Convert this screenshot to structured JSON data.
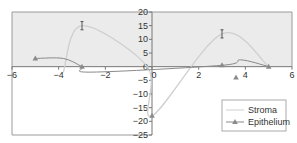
{
  "chart_data": {
    "type": "line",
    "title": "",
    "xlabel": "",
    "ylabel": "",
    "xlim": [
      -6,
      6
    ],
    "ylim": [
      -25,
      20
    ],
    "xticks": [
      -6,
      -4,
      -2,
      0,
      2,
      4,
      6
    ],
    "yticks": [
      20,
      15,
      10,
      5,
      0,
      -5,
      -10,
      -15,
      -20,
      -25
    ],
    "grid": false,
    "shaded_region": {
      "from": 0,
      "to": 20,
      "color": "#ebebeb"
    },
    "legend": {
      "position": "bottom-right",
      "entries": [
        "Stroma",
        "Epithelium"
      ]
    },
    "series": [
      {
        "name": "Stroma",
        "color": "#cfcfcf",
        "marker": "none",
        "points": [
          [
            -3.8,
            -2
          ],
          [
            -3,
            15
          ],
          [
            -0.2,
            0
          ],
          [
            0,
            -18
          ],
          [
            3,
            12
          ],
          [
            5,
            0
          ]
        ],
        "error_bars": [
          {
            "x": -3,
            "y": 15,
            "err": 1.5
          },
          {
            "x": 3,
            "y": 12,
            "err": 1.5
          }
        ]
      },
      {
        "name": "Epithelium",
        "color": "#8a8a8a",
        "marker": "triangle",
        "points": [
          [
            -5,
            3
          ],
          [
            -3,
            0
          ],
          [
            0,
            -18
          ],
          [
            3,
            0.5
          ],
          [
            5,
            0
          ]
        ],
        "line_path": [
          [
            -5,
            3
          ],
          [
            -3.8,
            3
          ],
          [
            -3,
            0
          ],
          [
            -2.6,
            -2
          ],
          [
            3,
            0.5
          ],
          [
            3.8,
            2.5
          ],
          [
            5,
            0
          ]
        ],
        "extra_markers": [
          [
            3.6,
            -4
          ]
        ]
      }
    ]
  }
}
